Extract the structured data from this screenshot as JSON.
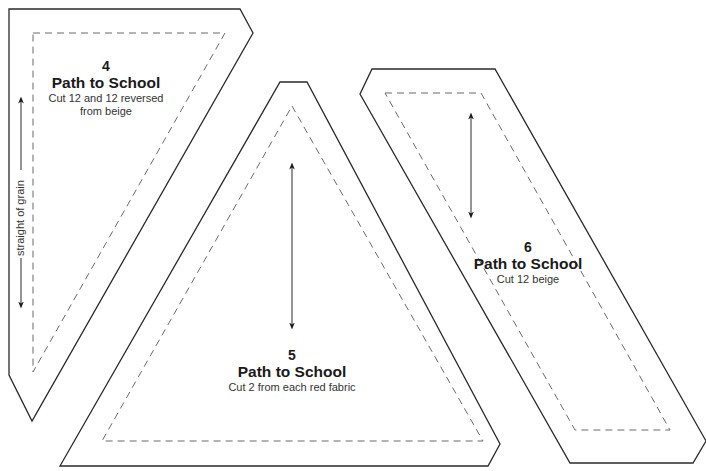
{
  "pieces": [
    {
      "number": "4",
      "title": "Path to School",
      "instructions_line1": "Cut 12 and 12 reversed",
      "instructions_line2": "from beige"
    },
    {
      "number": "5",
      "title": "Path to School",
      "instructions_line1": "Cut 2 from each red fabric"
    },
    {
      "number": "6",
      "title": "Path to School",
      "instructions_line1": "Cut 12 beige"
    }
  ],
  "grain_label": "straight of grain",
  "colors": {
    "outline": "#2a2a2a",
    "seam": "#6a6a6a",
    "background": "#ffffff"
  }
}
